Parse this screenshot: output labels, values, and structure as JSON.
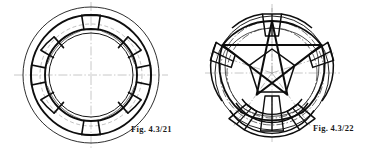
{
  "page": {
    "background": "#ffffff",
    "width": 380,
    "height": 151,
    "kind": "engineering-drawing-plate"
  },
  "ink": {
    "heavy": "#111111",
    "medium": "#2b2b2b",
    "light": "#555555",
    "centerline": "#9a9a9a",
    "construction": "#8d8d8d"
  },
  "figures": [
    {
      "id": "fig-left",
      "caption": "Fig.  4.3/21",
      "subject": "octagonal segmented ring construction",
      "center": {
        "x": 91,
        "y": 75
      },
      "radii": {
        "outer_circle": 68,
        "segment_outer": 60,
        "segment_inner": 46,
        "inner_circle": 42,
        "construction_arc": 51
      },
      "segments": 8,
      "start_angle_deg": -90,
      "centerlines": {
        "horizontal": true,
        "vertical": true,
        "style": "dash-dot"
      }
    },
    {
      "id": "fig-right",
      "caption": "Fig.  4.3/22",
      "subject": "pentagonal five-point star ring construction",
      "center": {
        "x": 272,
        "y": 73
      },
      "radii": {
        "outer_circle": 57,
        "star_outer": 52,
        "star_inner": 26,
        "inner_circle": 24,
        "construction_arc_1": 49,
        "construction_arc_2": 44
      },
      "points": 5,
      "start_angle_deg": -90,
      "centerlines": {
        "horizontal": true,
        "vertical": true,
        "radial_count": 5,
        "style": "dash-dot"
      }
    }
  ],
  "captions": {
    "left": "Fig.  4.3/21",
    "right": "Fig.  4.3/22"
  }
}
